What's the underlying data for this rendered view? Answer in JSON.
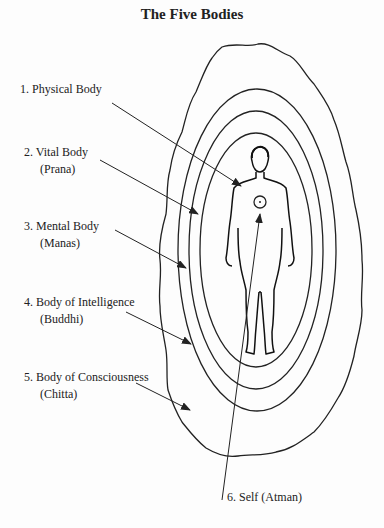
{
  "title": "The Five Bodies",
  "labels": [
    {
      "num": "1. Physical Body",
      "sub": ""
    },
    {
      "num": "2. Vital Body",
      "sub": "(Prana)"
    },
    {
      "num": "3. Mental Body",
      "sub": "(Manas)"
    },
    {
      "num": "4. Body of Intelligence",
      "sub": "(Buddhi)"
    },
    {
      "num": "5. Body of Consciousness",
      "sub": "(Chitta)"
    },
    {
      "num": "6. Self (Atman)",
      "sub": ""
    }
  ]
}
